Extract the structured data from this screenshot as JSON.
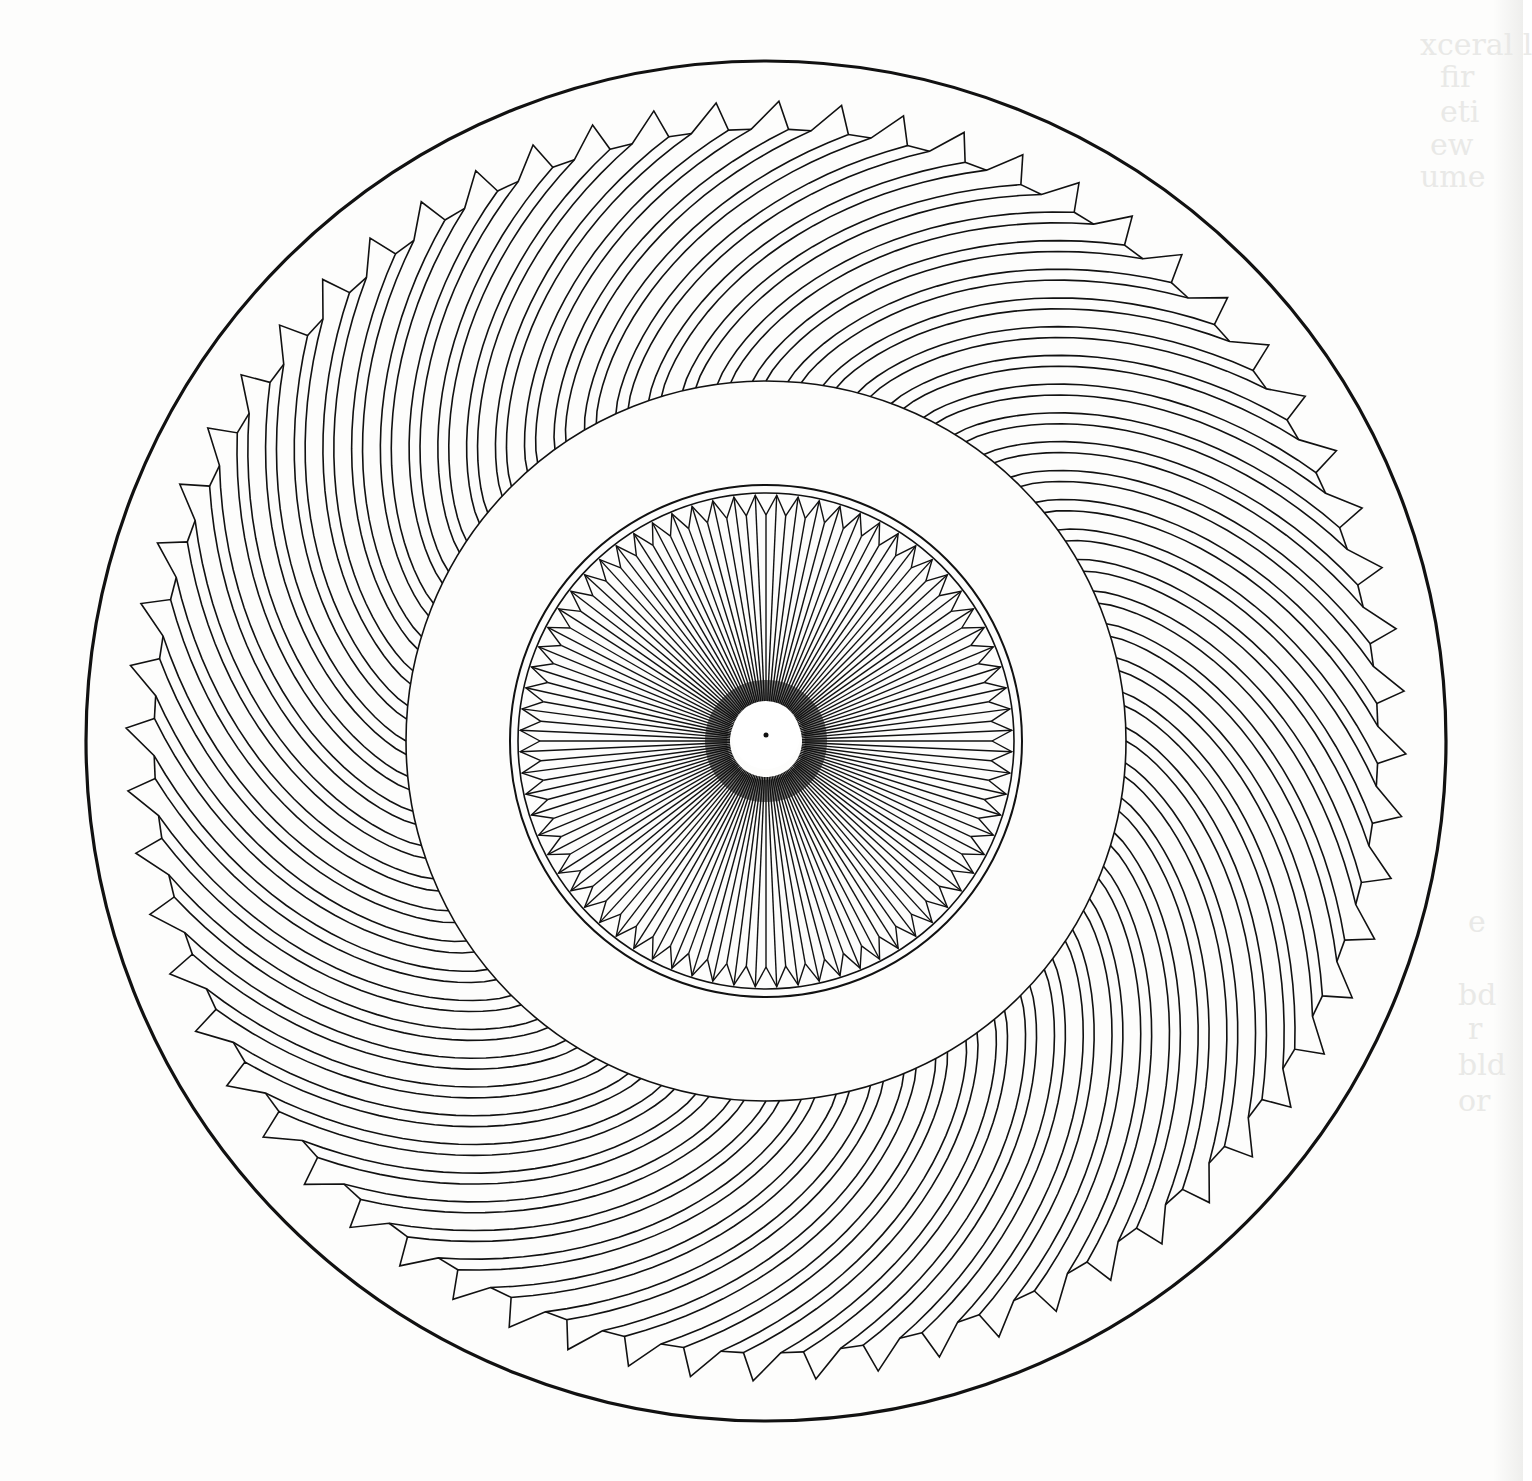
{
  "figure": {
    "type": "technical-illustration",
    "colors": {
      "paper": "#fdfdfc",
      "ink": "#111111",
      "hub": "#ffffff",
      "ghost_text": "#d9d9d6"
    },
    "center": {
      "x": 766,
      "y": 741
    },
    "outer_rim": {
      "radius": 680,
      "stroke_width": 3.2
    },
    "outer_gear": {
      "tooth_count": 64,
      "tip_radius": 640,
      "root_radius": 612,
      "inner_boundary_radius": 360,
      "spiral_angle_deg": 38,
      "stroke_width": 1.6
    },
    "blank_annulus": {
      "outer_radius": 360,
      "inner_radius": 256
    },
    "inner_gear": {
      "outer_circle_radius": 256,
      "inner_circle_radius": 248,
      "tooth_count": 72,
      "tooth_tip_radius": 246,
      "tooth_root_radius": 226,
      "hub_radius": 36,
      "stroke_width": 1.4
    },
    "hub": {
      "radius": 34,
      "center_dot_radius": 2.5,
      "center_offset_y": -6
    }
  },
  "bleed_through_text": [
    {
      "x": 1420,
      "y": 28,
      "text": "xceral l"
    },
    {
      "x": 1440,
      "y": 60,
      "text": "fir"
    },
    {
      "x": 1440,
      "y": 95,
      "text": "eti"
    },
    {
      "x": 1430,
      "y": 128,
      "text": "ew"
    },
    {
      "x": 1420,
      "y": 160,
      "text": "ume"
    },
    {
      "x": 1468,
      "y": 905,
      "text": "e"
    },
    {
      "x": 1458,
      "y": 978,
      "text": "bd"
    },
    {
      "x": 1468,
      "y": 1012,
      "text": "r"
    },
    {
      "x": 1458,
      "y": 1048,
      "text": "bld"
    },
    {
      "x": 1458,
      "y": 1084,
      "text": "or"
    }
  ]
}
